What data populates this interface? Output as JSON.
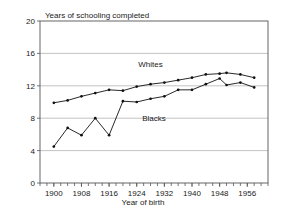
{
  "chart_data": {
    "type": "line",
    "title": "Years of schooling completed",
    "xlabel": "Year of birth",
    "ylabel": "",
    "xlim": [
      1896,
      1962
    ],
    "ylim": [
      0,
      20
    ],
    "grid": true,
    "legend_position": "inline-annotations",
    "y_ticks": [
      0,
      4,
      8,
      12,
      16,
      20
    ],
    "y_tick_labels": [
      "0",
      "4",
      "8",
      "12",
      "16",
      "20"
    ],
    "x_ticks": [
      1900,
      1908,
      1916,
      1924,
      1932,
      1940,
      1948,
      1956
    ],
    "x_tick_labels": [
      "1900",
      "1908",
      "1916",
      "1924",
      "1932",
      "1940",
      "1948",
      "1956"
    ],
    "x_minor_tick_step": 2,
    "series": [
      {
        "name": "Whites",
        "color": "#111111",
        "label_x": 1928,
        "label_y": 14.3,
        "x": [
          1900,
          1904,
          1908,
          1912,
          1916,
          1920,
          1924,
          1928,
          1932,
          1936,
          1940,
          1944,
          1948,
          1950,
          1954,
          1958
        ],
        "values": [
          9.9,
          10.2,
          10.7,
          11.1,
          11.5,
          11.4,
          11.9,
          12.2,
          12.4,
          12.7,
          13.0,
          13.4,
          13.5,
          13.6,
          13.4,
          13.0
        ]
      },
      {
        "name": "Blacks",
        "color": "#111111",
        "label_x": 1929,
        "label_y": 7.6,
        "x": [
          1900,
          1904,
          1908,
          1912,
          1916,
          1920,
          1924,
          1928,
          1932,
          1936,
          1940,
          1944,
          1948,
          1950,
          1954,
          1958
        ],
        "values": [
          4.5,
          6.8,
          5.9,
          8.0,
          5.9,
          10.1,
          10.0,
          10.4,
          10.7,
          11.5,
          11.5,
          12.2,
          12.9,
          12.1,
          12.4,
          11.8
        ]
      }
    ]
  }
}
